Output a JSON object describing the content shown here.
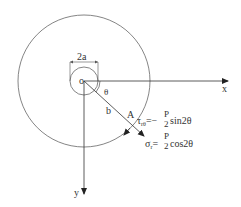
{
  "diagram": {
    "labels": {
      "origin": "o",
      "diameter": "2a",
      "angle": "θ",
      "radius": "b",
      "point": "A",
      "x_axis": "x",
      "y_axis": "y"
    },
    "formulas": {
      "shear": {
        "lhs": "τ",
        "lhs_sub": "rθ",
        "eq": "=−",
        "num": "P",
        "den": "2",
        "rhs": "sin2θ"
      },
      "normal": {
        "lhs": "σ",
        "lhs_sub": "r",
        "eq": "=",
        "num": "P",
        "den": "2",
        "rhs": "cos2θ"
      }
    },
    "colors": {
      "line": "#333333",
      "circle": "#666666"
    }
  }
}
